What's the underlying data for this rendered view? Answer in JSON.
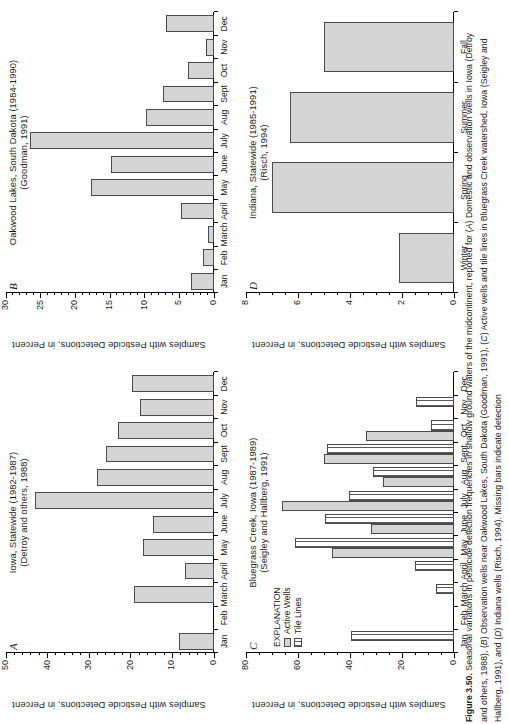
{
  "figure": {
    "number": "Figure 3.50.",
    "caption_text": "Seasonal variations in pesticide detection frequencies in shallow ground waters of the midcontinent, reported for (A) Domestic and observation wells in Iowa (Detroy and others, 1988), (B) Observation wells near Oakwood Lakes, South Dakota (Goodman, 1991), (C) Active wells and tile lines in Bluegrass Creek watershed, Iowa (Seigley and Hallberg, 1991), and (D) Indiana wells (Risch, 1994). Missing bars indicate detection",
    "orientation": "rotated-90"
  },
  "shared": {
    "ytitle": "Samples with Pesticide Detections, in Percent",
    "months": [
      "Jan",
      "Feb",
      "March",
      "April",
      "May",
      "June",
      "July",
      "Aug",
      "Sept",
      "Oct",
      "Nov",
      "Dec"
    ],
    "seasons": [
      "Winter",
      "Spring",
      "Summer",
      "Fall"
    ],
    "bar_fill": "#d4d4d4",
    "bar_stroke": "#4a4a4a"
  },
  "legend": {
    "title": "EXPLANATION",
    "items": [
      {
        "label": "Active Wells",
        "style": "solid-gray"
      },
      {
        "label": "Tile Lines",
        "style": "hatched"
      }
    ]
  },
  "chart_data": [
    {
      "id": "A",
      "letter": "A",
      "type": "bar",
      "title": "Iowa, Statewide (1982-1987)",
      "subtitle": "(Detroy and others, 1988)",
      "title_lines": [
        "Iowa, Statewide (1982-1987)",
        "(Detroy and others, 1988)"
      ],
      "xlabel": "",
      "ylabel": "Samples with Pesticide Detections, in Percent",
      "ylim": [
        0,
        50
      ],
      "yticks": [
        0,
        10,
        20,
        30,
        40,
        50
      ],
      "yminor_step": 2,
      "grid": false,
      "categories": [
        "Jan",
        "Feb",
        "March",
        "April",
        "May",
        "June",
        "July",
        "Aug",
        "Sept",
        "Oct",
        "Nov",
        "Dec"
      ],
      "values": [
        8.3,
        0,
        19.2,
        7.0,
        17.1,
        14.6,
        43.0,
        28.2,
        26.0,
        23.0,
        17.8,
        19.7
      ]
    },
    {
      "id": "B",
      "letter": "B",
      "type": "bar",
      "title": "Oakwood Lakes, South Dakota (1984-1990)",
      "subtitle": "(Goodman, 1991)",
      "title_lines": [
        "Oakwood Lakes, South Dakota (1984-1990)",
        "(Goodman, 1991)"
      ],
      "xlabel": "",
      "ylabel": "Samples with Pesticide Detections, in Percent",
      "ylim": [
        0,
        30
      ],
      "yticks": [
        0,
        5,
        10,
        15,
        20,
        25,
        30
      ],
      "yminor_step": 1,
      "grid": false,
      "categories": [
        "Jan",
        "Feb",
        "March",
        "April",
        "May",
        "June",
        "July",
        "Aug",
        "Sept",
        "Oct",
        "Nov",
        "Dec"
      ],
      "values": [
        3.3,
        1.6,
        0.9,
        4.8,
        17.7,
        14.8,
        26.6,
        9.8,
        7.3,
        3.8,
        1.1,
        6.9
      ]
    },
    {
      "id": "C",
      "letter": "C",
      "type": "bar",
      "title": "Bluegrass Creek, Iowa (1987-1989)",
      "subtitle": "(Seigley and Hallberg, 1991)",
      "title_lines": [
        "Bluegrass Creek, Iowa (1987-1989)",
        "(Seigley and Hallberg, 1991)"
      ],
      "xlabel": "",
      "ylabel": "Samples with Pesticide Detections, in Percent",
      "ylim": [
        0,
        80
      ],
      "yticks": [
        0,
        20,
        40,
        60,
        80
      ],
      "yminor_step": 5,
      "grid": false,
      "categories": [
        "Jan",
        "Feb",
        "March",
        "April",
        "May",
        "June",
        "July",
        "Aug",
        "Sept",
        "Oct",
        "Nov",
        "Dec"
      ],
      "series": [
        {
          "name": "Active Wells",
          "style": "solid-gray",
          "values": [
            0,
            0,
            0,
            0,
            47.0,
            32.0,
            66.0,
            27.5,
            50.0,
            34.0,
            0,
            0
          ]
        },
        {
          "name": "Tile Lines",
          "style": "hatched",
          "values": [
            39.5,
            0,
            7.0,
            15.0,
            61.0,
            49.5,
            40.5,
            31.0,
            49.0,
            9.0,
            14.5,
            0
          ]
        }
      ]
    },
    {
      "id": "D",
      "letter": "D",
      "type": "bar",
      "title": "Indiana, Statewide (1985-1991)",
      "subtitle": "(Risch, 1994)",
      "title_lines": [
        "Indiana, Statewide (1985-1991)",
        "(Risch, 1994)"
      ],
      "xlabel": "",
      "ylabel": "Samples with Pesticide Detections, in Percent",
      "ylim": [
        0,
        8
      ],
      "yticks": [
        0,
        2,
        4,
        6,
        8
      ],
      "yminor_step": 0.5,
      "grid": false,
      "categories": [
        "Winter",
        "Spring",
        "Summer",
        "Fall"
      ],
      "values": [
        2.1,
        7.0,
        6.3,
        5.0
      ]
    }
  ]
}
